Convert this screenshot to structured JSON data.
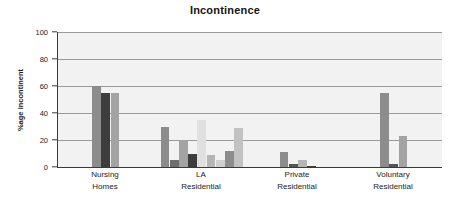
{
  "chart_data": {
    "type": "bar",
    "title": "Incontinence",
    "xlabel": "",
    "ylabel": "%age incontinent",
    "ylim": [
      0,
      100
    ],
    "yticks": [
      0,
      20,
      40,
      60,
      80,
      100
    ],
    "ytick_labels": [
      "0",
      "20",
      "40",
      "60",
      "80",
      "100"
    ],
    "grid": true,
    "legend": false,
    "categories": [
      "Nursing Homes",
      "LA Residential",
      "Private Residential",
      "Voluntary Residential"
    ],
    "category_lines": [
      [
        "Nursing",
        "Homes"
      ],
      [
        "LA",
        "Residential"
      ],
      [
        "Private",
        "Residential"
      ],
      [
        "Voluntary",
        "Residential"
      ]
    ],
    "groups": [
      {
        "category": "Nursing Homes",
        "bars": [
          {
            "value": 60,
            "color": "#8c8c8c"
          },
          {
            "value": 55,
            "color": "#3d3d3d"
          },
          {
            "value": 55,
            "color": "#a3a3a3"
          }
        ]
      },
      {
        "category": "LA Residential",
        "bars": [
          {
            "value": 30,
            "color": "#8c8c8c"
          },
          {
            "value": 5,
            "color": "#6e6e6e"
          },
          {
            "value": 20,
            "color": "#a3a3a3"
          },
          {
            "value": 10,
            "color": "#3d3d3d"
          },
          {
            "value": 35,
            "color": "#e0e0e0"
          },
          {
            "value": 9,
            "color": "#b5b5b5"
          },
          {
            "value": 5,
            "color": "#cfcfcf"
          },
          {
            "value": 12,
            "color": "#8c8c8c"
          },
          {
            "value": 29,
            "color": "#c2c2c2"
          }
        ]
      },
      {
        "category": "Private Residential",
        "bars": [
          {
            "value": 11,
            "color": "#8c8c8c"
          },
          {
            "value": 2,
            "color": "#555555"
          },
          {
            "value": 5,
            "color": "#b5b5b5"
          },
          {
            "value": 1,
            "color": "#3d3d3d"
          }
        ]
      },
      {
        "category": "Voluntary Residential",
        "bars": [
          {
            "value": 55,
            "color": "#8c8c8c"
          },
          {
            "value": 2,
            "color": "#555555"
          },
          {
            "value": 23,
            "color": "#a3a3a3"
          }
        ]
      }
    ]
  }
}
